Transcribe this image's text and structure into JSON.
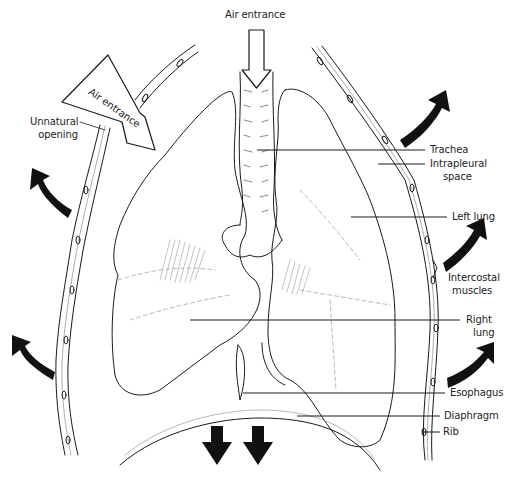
{
  "diagram": {
    "labels": {
      "air_entrance_top": "Air entrance",
      "air_entrance_side": "Air entrance",
      "unnatural_opening_line1": "Unnatural",
      "unnatural_opening_line2": "opening",
      "trachea": "Trachea",
      "intrapleural_line1": "Intrapleural",
      "intrapleural_line2": "space",
      "left_lung": "Left lung",
      "intercostal_line1": "Intercostal",
      "intercostal_line2": "muscles",
      "right_lung_line1": "Right",
      "right_lung_line2": "lung",
      "esophagus": "Esophagus",
      "diaphragm": "Diaphragm",
      "rib": "Rib"
    },
    "arrows": {
      "chest_wall_outward": 6,
      "diaphragm_downward": 2,
      "air_entrance": 2
    },
    "colors": {
      "line": "#1a1a1a",
      "background": "#ffffff",
      "hatch": "#9a9a9a"
    }
  }
}
